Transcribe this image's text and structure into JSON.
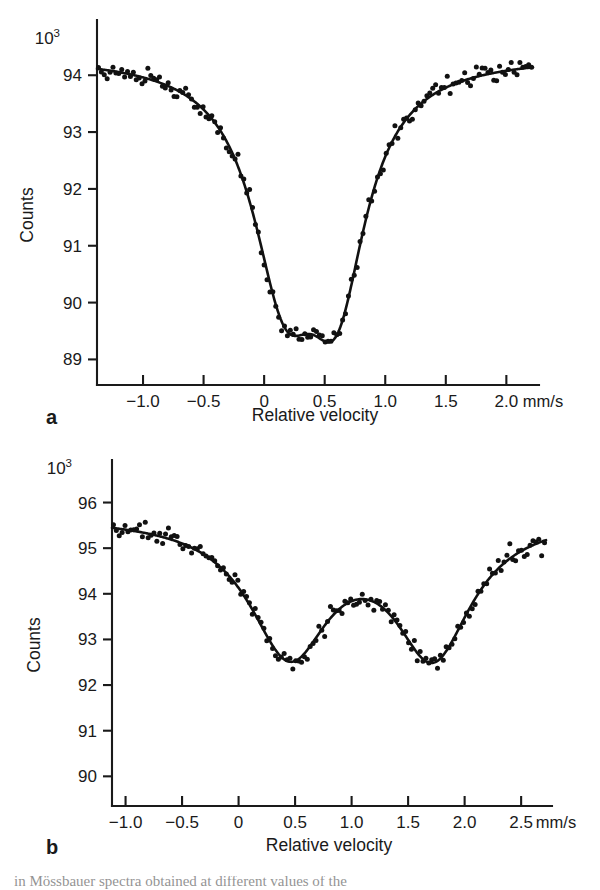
{
  "figure": {
    "background": "#ffffff",
    "ink_color": "#111111",
    "caption_partial": "in Mössbauer spectra obtained at different values of the"
  },
  "chart_data": [
    {
      "id": "panel-a",
      "type": "scatter",
      "panel_letter": "a",
      "title": "",
      "xlabel": "Relative velocity",
      "ylabel": "Counts",
      "xunit": "mm/s",
      "y_exponent_base": "10",
      "y_exponent_sup": "3",
      "xlim": [
        -1.38,
        2.22
      ],
      "ylim": [
        88.55,
        94.62
      ],
      "xticks": [
        -1.0,
        -0.5,
        0,
        0.5,
        1.0,
        1.5,
        2.0
      ],
      "xticklabels": [
        "−1.0",
        "−0.5",
        "0",
        "0.5",
        "1.0",
        "1.5",
        "2.0"
      ],
      "yticks": [
        89,
        90,
        91,
        92,
        93,
        94
      ],
      "yticklabels": [
        "89",
        "90",
        "91",
        "92",
        "93",
        "94"
      ],
      "grid": false,
      "legend": "none",
      "fit_model": "two-lorentzian-doublet",
      "baseline": 94.35,
      "peaks": [
        {
          "center": 0.17,
          "depth": 3.62,
          "hwhm": 0.33
        },
        {
          "center": 0.6,
          "depth": 3.58,
          "hwhm": 0.3
        }
      ],
      "central_maximum": {
        "x": 0.39,
        "y": 91.55
      },
      "minima": [
        {
          "x": 0.17,
          "y": 90.72
        },
        {
          "x": 0.6,
          "y": 90.7
        }
      ],
      "noise_amplitude": 0.13,
      "n_points": 150
    },
    {
      "id": "panel-b",
      "type": "scatter",
      "panel_letter": "b",
      "title": "",
      "xlabel": "Relative velocity",
      "ylabel": "Counts",
      "xunit": "mm/s",
      "y_exponent_base": "10",
      "y_exponent_sup": "3",
      "xlim": [
        -1.12,
        2.72
      ],
      "ylim": [
        89.35,
        96.45
      ],
      "xticks": [
        -1.0,
        -0.5,
        0,
        0.5,
        1.0,
        1.5,
        2.0,
        2.5
      ],
      "xticklabels": [
        "−1.0",
        "−0.5",
        "0",
        "0.5",
        "1.0",
        "1.5",
        "2.0",
        "2.5"
      ],
      "yticks": [
        90,
        91,
        92,
        93,
        94,
        95,
        96
      ],
      "yticklabels": [
        "90",
        "91",
        "92",
        "93",
        "94",
        "95",
        "96"
      ],
      "grid": false,
      "legend": "none",
      "fit_model": "two-lorentzian-doublet",
      "baseline": 95.72,
      "peaks": [
        {
          "center": 0.45,
          "depth": 2.92,
          "hwhm": 0.44
        },
        {
          "center": 1.72,
          "depth": 2.92,
          "hwhm": 0.42
        }
      ],
      "central_maximum": {
        "x": 1.09,
        "y": 94.97
      },
      "minima": [
        {
          "x": 0.45,
          "y": 92.85
        },
        {
          "x": 1.72,
          "y": 92.88
        }
      ],
      "noise_amplitude": 0.16,
      "n_points": 150
    }
  ]
}
